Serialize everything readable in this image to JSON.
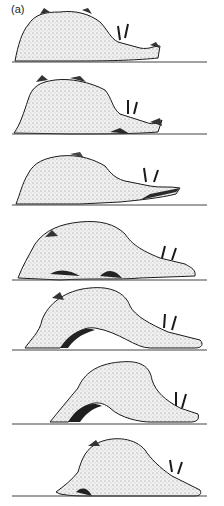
{
  "figure": {
    "panel_label": "(a)",
    "colors": {
      "ink": "#1a1a1a",
      "stipple_fill": "#e6e6e6",
      "shadow": "#2a2a2a",
      "background": "#ffffff"
    },
    "ground_line": {
      "x_start": 12,
      "x_end": 207
    },
    "frames": [
      {
        "index": 1,
        "ground_y": 62,
        "pose": "flat"
      },
      {
        "index": 2,
        "ground_y": 134,
        "pose": "flat-raised-head"
      },
      {
        "index": 3,
        "ground_y": 205,
        "pose": "head-extended"
      },
      {
        "index": 4,
        "ground_y": 280,
        "pose": "slight-arch"
      },
      {
        "index": 5,
        "ground_y": 350,
        "pose": "arched"
      },
      {
        "index": 6,
        "ground_y": 424,
        "pose": "high-arch"
      },
      {
        "index": 7,
        "ground_y": 496,
        "pose": "contracted-forward"
      }
    ]
  }
}
